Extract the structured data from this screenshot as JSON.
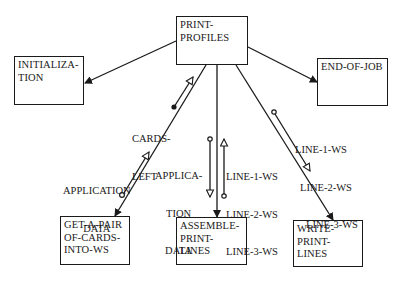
{
  "modules": {
    "root": {
      "lines": [
        "PRINT-",
        "PROFILES"
      ]
    },
    "init": {
      "lines": [
        "INITIALIZA-",
        "TION"
      ]
    },
    "end": {
      "lines": [
        "END-OF-JOB"
      ]
    },
    "get": {
      "lines": [
        "GET-A-PAIR",
        "OF-CARDS-",
        "INTO-WS"
      ]
    },
    "assemble": {
      "lines": [
        "ASSEMBLE-",
        "PRINT-",
        "LINES"
      ]
    },
    "write": {
      "lines": [
        "WRITE-",
        "PRINT-",
        "LINES"
      ]
    }
  },
  "couples": {
    "cards_left": {
      "lines": [
        "CARDS-",
        "LEFT"
      ],
      "type": "control-flag"
    },
    "app_data_get": {
      "lines": [
        "APPLICATION",
        "DATA"
      ],
      "type": "data"
    },
    "app_data_assemble": {
      "lines": [
        "APPLICA-",
        "TION",
        "DATA"
      ],
      "type": "data"
    },
    "lines_ws_assemble": {
      "lines": [
        "LINE-1-WS",
        "LINE-2-WS",
        "LINE-3-WS"
      ],
      "type": "data"
    },
    "lines_ws_write": {
      "lines": [
        "LINE-1-WS",
        "LINE-2-WS",
        "LINE-3-WS"
      ],
      "type": "data"
    }
  }
}
